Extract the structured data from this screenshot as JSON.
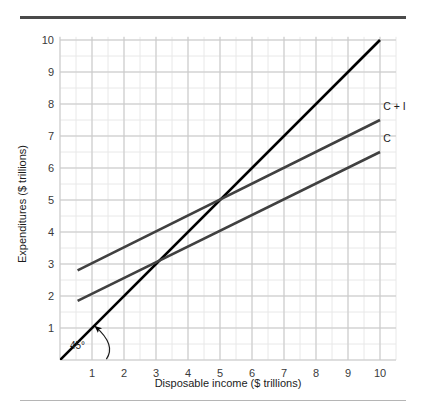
{
  "figure": {
    "top_rule_color": "#4a4a4a",
    "bottom_rule_color": "#b5b5b5",
    "background": "#ffffff"
  },
  "chart_data": {
    "type": "line",
    "title": "",
    "xlabel": "Disposable income ($ trillions)",
    "ylabel": "Expenditures ($ trillions)",
    "xlim": [
      0,
      10.5
    ],
    "ylim": [
      0,
      10.1
    ],
    "xticks": [
      1,
      2,
      3,
      4,
      5,
      6,
      7,
      8,
      9,
      10
    ],
    "yticks": [
      1,
      2,
      3,
      4,
      5,
      6,
      7,
      8,
      9,
      10
    ],
    "xtick_labels": [
      "1",
      "2",
      "3",
      "4",
      "5",
      "6",
      "7",
      "8",
      "9",
      "10"
    ],
    "ytick_labels": [
      "1",
      "2",
      "3",
      "4",
      "5",
      "6",
      "7",
      "8",
      "9",
      "10"
    ],
    "grid": true,
    "grid_major_color": "#c9c9c9",
    "grid_minor_color": "#e8e8e8",
    "grid_minor_step": 0.5,
    "legend": "none",
    "series": [
      {
        "name": "45-degree line",
        "label": "45°",
        "color": "#000000",
        "width": 2.6,
        "x": [
          0,
          10
        ],
        "y": [
          0,
          10
        ],
        "slope": 1.0,
        "intercept": 0.0
      },
      {
        "name": "C + I",
        "label": "C + I",
        "color": "#404040",
        "width": 2.6,
        "x": [
          0.55,
          10
        ],
        "y": [
          2.8,
          7.5
        ],
        "slope": 0.5,
        "intercept": 2.5
      },
      {
        "name": "C",
        "label": "C",
        "color": "#404040",
        "width": 2.6,
        "x": [
          0.55,
          10
        ],
        "y": [
          1.85,
          6.5
        ],
        "slope": 0.5,
        "intercept": 1.6
      }
    ],
    "annotations": [
      {
        "name": "angle-annotation",
        "text": "45°",
        "x": 1.0,
        "y": 0.45,
        "arrow_to_x": 1.1,
        "arrow_to_y": 1.05
      },
      {
        "name": "c-plus-i-label",
        "text": "C + I",
        "x": 10.1,
        "y": 7.95
      },
      {
        "name": "c-label",
        "text": "C",
        "x": 10.1,
        "y": 6.95
      }
    ],
    "equilibrium": {
      "x": 5,
      "y": 5
    },
    "intersection_c_with_45": {
      "x": 3.2,
      "y": 3.2
    }
  }
}
